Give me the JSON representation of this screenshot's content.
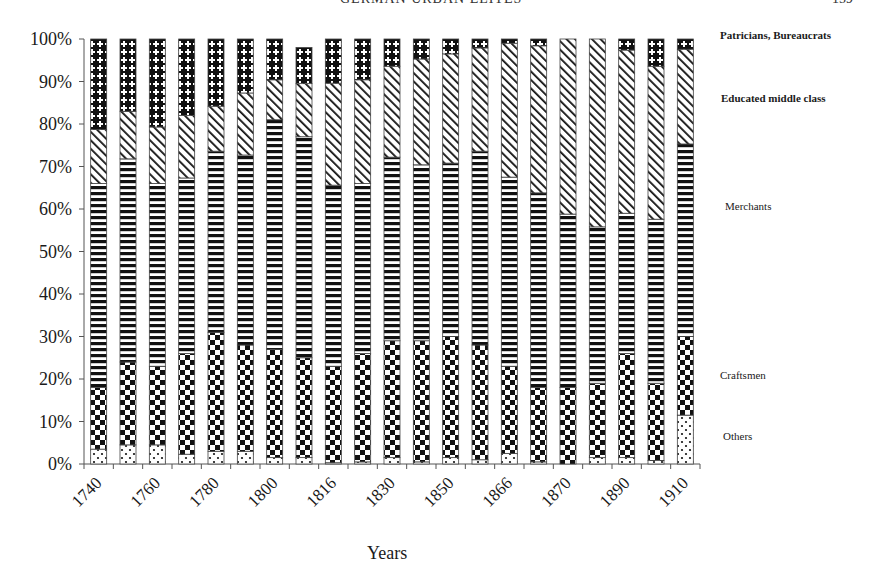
{
  "page": {
    "header": "GERMAN URBAN ELITES",
    "page_number": "159"
  },
  "chart_data": {
    "type": "bar",
    "stacked": true,
    "normalized_percent": true,
    "title": "",
    "xlabel": "Years",
    "ylabel": "",
    "ylim": [
      0,
      100
    ],
    "yticks": [
      "0%",
      "10%",
      "20%",
      "30%",
      "40%",
      "50%",
      "60%",
      "70%",
      "80%",
      "90%",
      "100%"
    ],
    "xtick_labels": [
      "1740",
      "1760",
      "1780",
      "1800",
      "1816",
      "1830",
      "1850",
      "1866",
      "1870",
      "1890",
      "1910"
    ],
    "bar_count": 21,
    "label_every": 2,
    "grid": false,
    "legend_position": "right (inline labels beside last bar)",
    "series": [
      {
        "name": "Others",
        "pattern": "dots",
        "values": [
          3.5,
          4.5,
          4.5,
          2.3,
          3,
          3,
          1.5,
          1.5,
          0.3,
          0.5,
          1.5,
          0.5,
          1.5,
          1,
          2.5,
          0.5,
          0,
          1.5,
          1.5,
          0.8,
          11.5
        ]
      },
      {
        "name": "Craftsmen",
        "pattern": "checker",
        "values": [
          14.5,
          19.5,
          18.5,
          23.7,
          28,
          25,
          25.5,
          23.5,
          22.7,
          25.5,
          27.5,
          28.5,
          28.5,
          27,
          20.5,
          17.5,
          18,
          17.5,
          24.5,
          18.2,
          18.5
        ]
      },
      {
        "name": "Merchants",
        "pattern": "horizontal-stripes",
        "values": [
          48,
          47.8,
          43,
          41.3,
          42.6,
          44.7,
          54,
          52,
          42.6,
          40,
          43.2,
          41.4,
          40.8,
          45.6,
          44.5,
          45.8,
          40.8,
          36.8,
          33,
          38.6,
          45.3
        ]
      },
      {
        "name": "Educated middle class",
        "pattern": "diagonal-stripes",
        "values": [
          12.7,
          11.2,
          13.3,
          14.7,
          10.6,
          14.6,
          9.4,
          12.5,
          24,
          24.4,
          21.4,
          24.9,
          25.7,
          24.3,
          31.5,
          34.6,
          41.2,
          44.2,
          38.4,
          36,
          22.3
        ]
      },
      {
        "name": "Patricians, Bureaucrats",
        "pattern": "cross-hatch",
        "values": [
          21.3,
          17,
          20.7,
          18,
          15.8,
          12.7,
          9.6,
          8.5,
          10.4,
          9.6,
          6.4,
          4.7,
          3.5,
          2.1,
          1,
          1.6,
          0,
          0,
          2.6,
          6.4,
          2.4
        ]
      }
    ]
  },
  "legend": {
    "patricians": "Patricians, Bureaucrats",
    "educated": "Educated middle class",
    "merchants": "Merchants",
    "craftsmen": "Craftsmen",
    "others": "Others"
  },
  "axis": {
    "x_title": "Years"
  }
}
